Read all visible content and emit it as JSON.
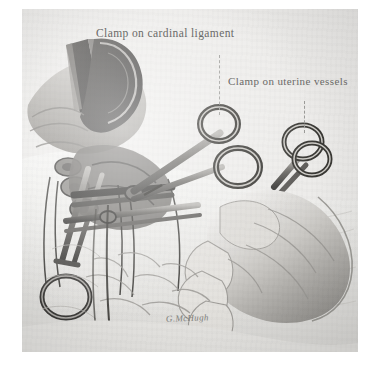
{
  "plate": {
    "medium": "pencil and wash medical illustration",
    "paper_color": "#ececeb",
    "margin_color": "#ffffff",
    "ink_color": "#6a6a68"
  },
  "labels": [
    {
      "id": "cardinal-ligament",
      "text": "Clamp on cardinal ligament",
      "leader": "dashed-vertical"
    },
    {
      "id": "uterine-vessels",
      "text": "Clamp on uterine vessels",
      "leader": "dashed-vertical"
    }
  ],
  "signature": {
    "text": "G.McHugh"
  },
  "scene": {
    "title": "Clamping the cardinal ligament and uterine vessels",
    "elements": [
      "retractor-blade",
      "incised-tissue-flap",
      "cardinal-ligament-clamp",
      "uterine-vessel-clamp",
      "lower-left-clamp",
      "surgeons-gloved-hand",
      "surgical-drapes",
      "ligature-strands"
    ]
  }
}
